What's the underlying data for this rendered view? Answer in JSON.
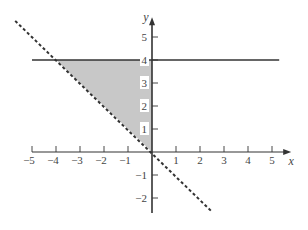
{
  "chart_data": {
    "type": "line",
    "title": "",
    "xlabel": "x",
    "ylabel": "y",
    "xlim": [
      -5,
      5
    ],
    "ylim": [
      -2,
      5
    ],
    "grid": false,
    "x_ticks": [
      -5,
      -4,
      -3,
      -2,
      -1,
      1,
      2,
      3,
      4,
      5
    ],
    "x_tick_labels": [
      "−5",
      "−4",
      "−3",
      "−2",
      "−1",
      "1",
      "2",
      "3",
      "4",
      "5"
    ],
    "y_ticks": [
      -2,
      -1,
      1,
      2,
      3,
      4,
      5
    ],
    "y_tick_labels": [
      "−2",
      "−1",
      "1",
      "2",
      "3",
      "4",
      "5"
    ],
    "series": [
      {
        "name": "y = 4",
        "style": "solid",
        "points": [
          [
            -5,
            4
          ],
          [
            5.3,
            4
          ]
        ]
      },
      {
        "name": "y = -x",
        "style": "dashed",
        "points": [
          [
            -5.7,
            5.7
          ],
          [
            2.5,
            -2.6
          ]
        ]
      }
    ],
    "shaded_region": {
      "description": "region bounded by y = 4, y = -x, and x = 0",
      "vertices": [
        [
          -4,
          4
        ],
        [
          0,
          4
        ],
        [
          0,
          0
        ]
      ],
      "color": "#c8c8c8"
    },
    "colors": {
      "axis": "#333333",
      "line": "#333333",
      "shade": "#c8c8c8"
    }
  }
}
